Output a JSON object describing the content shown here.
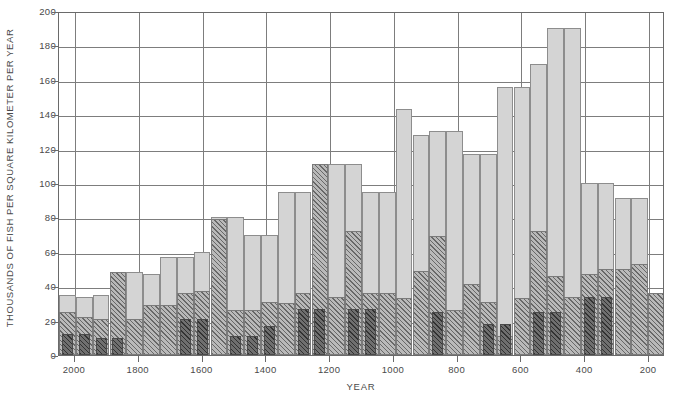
{
  "chart_data": {
    "type": "bar",
    "title": "",
    "xlabel": "YEAR",
    "ylabel": "THOUSANDS OF FISH PER SQUARE KILOMETER PER YEAR",
    "xlim": [
      2050,
      150
    ],
    "ylim": [
      0,
      200
    ],
    "x_reversed": true,
    "grid": true,
    "legend_position": "none",
    "y_ticks": [
      0,
      20,
      40,
      60,
      80,
      100,
      120,
      140,
      160,
      180,
      200
    ],
    "x_ticks": [
      2000,
      1800,
      1600,
      1400,
      1200,
      1000,
      800,
      600,
      400,
      200
    ],
    "bar_width_years": 50,
    "colors": {
      "series_bottom": "#6f6f6f",
      "series_middle": "#b9b9b9",
      "series_top": "#d4d4d4",
      "axis": "#6a6a6a",
      "gridline": "#7d7d7d",
      "text": "#4a4a4a",
      "background": "#ffffff"
    },
    "series": [
      {
        "name": "bottom-dark-hatched",
        "values": [
          12,
          12,
          10,
          10,
          0,
          0,
          0,
          21,
          21,
          0,
          11,
          11,
          17,
          0,
          27,
          27,
          0,
          27,
          27,
          0,
          0,
          0,
          25,
          0,
          0,
          18,
          18,
          0,
          25,
          25,
          0,
          34,
          34,
          0,
          0,
          0
        ]
      },
      {
        "name": "middle-hatched",
        "values": [
          25,
          22,
          21,
          48,
          21,
          29,
          29,
          36,
          37,
          79,
          26,
          26,
          31,
          30,
          36,
          111,
          34,
          72,
          36,
          36,
          33,
          49,
          69,
          26,
          41,
          31,
          11,
          33,
          72,
          46,
          34,
          47,
          50,
          50,
          53,
          36
        ]
      },
      {
        "name": "top-light-gray",
        "values": [
          35,
          34,
          35,
          48,
          48,
          47,
          57,
          57,
          60,
          80,
          80,
          70,
          70,
          95,
          95,
          111,
          111,
          111,
          95,
          95,
          143,
          128,
          130,
          130,
          117,
          117,
          156,
          156,
          169,
          190,
          190,
          100,
          100,
          91,
          91,
          36
        ]
      }
    ],
    "stacking": "stacked-overlay"
  },
  "bars": [
    {
      "year": 2025,
      "top": 35,
      "mid": 25,
      "bot": 12
    },
    {
      "year": 1975,
      "top": 34,
      "mid": 22,
      "bot": 12
    },
    {
      "year": 1925,
      "top": 35,
      "mid": 21,
      "bot": 10
    },
    {
      "year": 1875,
      "top": 48,
      "mid": 48,
      "bot": 10
    },
    {
      "year": 1825,
      "top": 48,
      "mid": 21,
      "bot": 0
    },
    {
      "year": 1775,
      "top": 47,
      "mid": 29,
      "bot": 0
    },
    {
      "year": 1725,
      "top": 57,
      "mid": 29,
      "bot": 0
    },
    {
      "year": 1675,
      "top": 57,
      "mid": 36,
      "bot": 21
    },
    {
      "year": 1625,
      "top": 60,
      "mid": 37,
      "bot": 21
    },
    {
      "year": 1575,
      "top": 80,
      "mid": 79,
      "bot": 0
    },
    {
      "year": 1525,
      "top": 80,
      "mid": 26,
      "bot": 11
    },
    {
      "year": 1475,
      "top": 70,
      "mid": 26,
      "bot": 11
    },
    {
      "year": 1425,
      "top": 70,
      "mid": 31,
      "bot": 17
    },
    {
      "year": 1375,
      "top": 95,
      "mid": 30,
      "bot": 0
    },
    {
      "year": 1325,
      "top": 95,
      "mid": 36,
      "bot": 27
    },
    {
      "year": 1275,
      "top": 111,
      "mid": 111,
      "bot": 27
    },
    {
      "year": 1225,
      "top": 111,
      "mid": 34,
      "bot": 0
    },
    {
      "year": 1175,
      "top": 111,
      "mid": 72,
      "bot": 27
    },
    {
      "year": 1125,
      "top": 95,
      "mid": 36,
      "bot": 27
    },
    {
      "year": 1075,
      "top": 95,
      "mid": 36,
      "bot": 0
    },
    {
      "year": 1025,
      "top": 143,
      "mid": 33,
      "bot": 0
    },
    {
      "year": 975,
      "top": 128,
      "mid": 49,
      "bot": 0
    },
    {
      "year": 925,
      "top": 130,
      "mid": 69,
      "bot": 25
    },
    {
      "year": 875,
      "top": 130,
      "mid": 26,
      "bot": 0
    },
    {
      "year": 825,
      "top": 117,
      "mid": 41,
      "bot": 0
    },
    {
      "year": 775,
      "top": 117,
      "mid": 31,
      "bot": 18
    },
    {
      "year": 725,
      "top": 156,
      "mid": 11,
      "bot": 18
    },
    {
      "year": 675,
      "top": 156,
      "mid": 33,
      "bot": 0
    },
    {
      "year": 625,
      "top": 169,
      "mid": 72,
      "bot": 25
    },
    {
      "year": 575,
      "top": 190,
      "mid": 46,
      "bot": 25
    },
    {
      "year": 525,
      "top": 190,
      "mid": 34,
      "bot": 0
    },
    {
      "year": 475,
      "top": 100,
      "mid": 47,
      "bot": 34
    },
    {
      "year": 425,
      "top": 100,
      "mid": 50,
      "bot": 34
    },
    {
      "year": 375,
      "top": 91,
      "mid": 50,
      "bot": 0
    },
    {
      "year": 325,
      "top": 91,
      "mid": 53,
      "bot": 0
    },
    {
      "year": 275,
      "top": 36,
      "mid": 36,
      "bot": 0
    }
  ],
  "axes": {
    "y_title": "THOUSANDS OF FISH PER SQUARE KILOMETER PER YEAR",
    "x_title": "YEAR",
    "y_ticks": [
      "200",
      "180",
      "160",
      "140",
      "120",
      "100",
      "80",
      "60",
      "40",
      "20",
      "0"
    ],
    "x_ticks": [
      "2000",
      "1800",
      "1600",
      "1400",
      "1200",
      "1000",
      "800",
      "600",
      "400",
      "200"
    ]
  }
}
